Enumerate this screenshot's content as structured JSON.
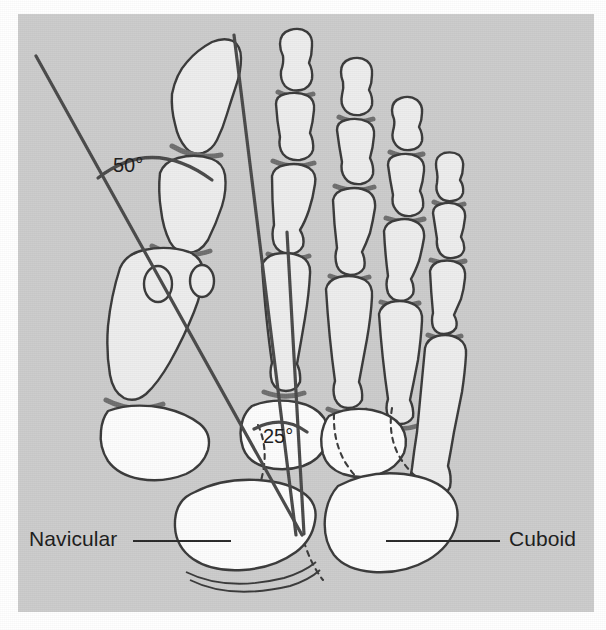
{
  "figure": {
    "view": "dorsoplantar",
    "background_color": "#cccccc",
    "page_color": "#ffffff",
    "outline_color": "#3a3a3a",
    "bone_fill_light": "#ededed",
    "bone_fill_white": "#fdfdfd",
    "joint_space_color": "#6f6f6f",
    "measurement_line_color": "#4a4a4a",
    "label_color": "#1c1c1c"
  },
  "labels": {
    "navicular": "Navicular",
    "cuboid": "Cuboid"
  },
  "angles": [
    {
      "name": "intermetatarsal-hallux-valgus-angle",
      "value": "50°",
      "degrees": 50,
      "between": [
        "medial reference axis",
        "first metatarsal axis"
      ]
    },
    {
      "name": "tarsal-angle",
      "value": "25°",
      "degrees": 25,
      "between": [
        "first metatarsal axis",
        "second metatarsal axis"
      ]
    }
  ],
  "leader_lines": [
    {
      "name": "navicular-leader",
      "from": "Navicular",
      "to": "navicular bone"
    },
    {
      "name": "cuboid-leader",
      "from": "Cuboid",
      "to": "cuboid bone"
    }
  ],
  "anatomy": {
    "rays": 5,
    "bone_groups": [
      "distal phalanges",
      "middle phalanges",
      "proximal phalanges",
      "metatarsals",
      "sesamoids",
      "cuneiforms",
      "navicular",
      "cuboid"
    ]
  }
}
